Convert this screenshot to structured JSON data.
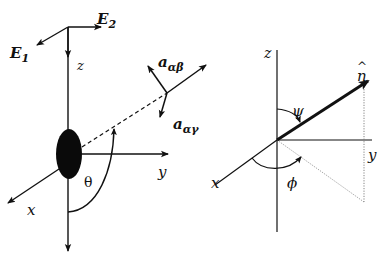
{
  "figure": {
    "left_panel": {
      "description": "Molecule frame with lab axes and polarization vectors",
      "labels": {
        "E1": "E",
        "E1_sub": "1",
        "E2": "E",
        "E2_sub": "2",
        "z": "z",
        "y": "y",
        "x": "x",
        "theta": "θ",
        "a_ab": "a",
        "a_ab_sub": "αβ",
        "a_ag": "a",
        "a_ag_sub": "αγ"
      }
    },
    "right_panel": {
      "description": "Unit vector n̂ with polar angle ψ and azimuth φ",
      "labels": {
        "z": "z",
        "y": "y",
        "x": "x",
        "n_hat": "n",
        "n_hat_accent": "^",
        "psi": "ψ",
        "phi": "ϕ"
      }
    },
    "colors": {
      "line": "#111111",
      "dotted": "#777777",
      "background": "#ffffff"
    }
  }
}
